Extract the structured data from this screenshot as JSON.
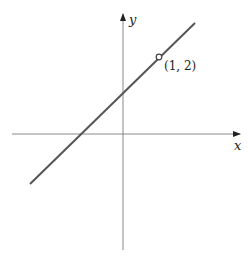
{
  "figure": {
    "axes": {
      "x_label": "x",
      "y_label": "y",
      "color": "#888888"
    },
    "line": {
      "color": "#555555",
      "description": "straight line with positive slope passing through (1, 2)"
    },
    "point": {
      "label": "(1, 2)",
      "x": 1,
      "y": 2,
      "marker": "open-circle"
    }
  }
}
